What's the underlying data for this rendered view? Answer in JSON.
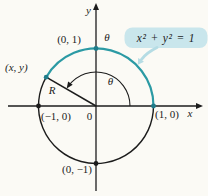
{
  "figure": {
    "background": "#fbfaf5",
    "ink": "#1c1c1c",
    "teal": "#2b9aa4",
    "dot_teal": "#1f7c8a",
    "callout": {
      "bg": "#c9e6ec",
      "tail": "#b5dce4",
      "equation": "x² + y² = 1"
    },
    "axis": {
      "x": "x",
      "y": "y",
      "origin": "0"
    },
    "labels": {
      "point_top": "(0, 1)",
      "point_right": "(1, 0)",
      "point_left": "(−1, 0)",
      "point_bottom": "(0, −1)",
      "point_generic": "(x, y)",
      "radius": "R",
      "central_angle": "θ",
      "arc_angle": "θ"
    }
  }
}
